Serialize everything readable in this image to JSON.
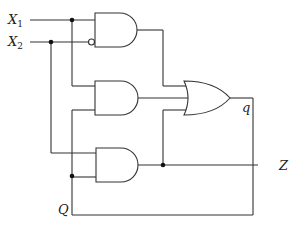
{
  "diagram": {
    "type": "logic-circuit",
    "inputs": [
      {
        "name": "X",
        "sub": "1"
      },
      {
        "name": "X",
        "sub": "2"
      }
    ],
    "labels": {
      "q": "q",
      "Z": "Z",
      "Q": "Q"
    },
    "gates": [
      {
        "id": "and-top",
        "type": "AND",
        "inputs": [
          "X1",
          "NOT X2"
        ]
      },
      {
        "id": "and-middle",
        "type": "AND",
        "inputs": [
          "X1",
          "Q"
        ]
      },
      {
        "id": "and-bottom",
        "type": "AND",
        "inputs": [
          "X2",
          "Q"
        ]
      },
      {
        "id": "or-output",
        "type": "OR",
        "inputs": [
          "and-top",
          "and-middle",
          "and-bottom"
        ],
        "output": "q"
      }
    ],
    "outputs": [
      "Z",
      "q"
    ]
  }
}
